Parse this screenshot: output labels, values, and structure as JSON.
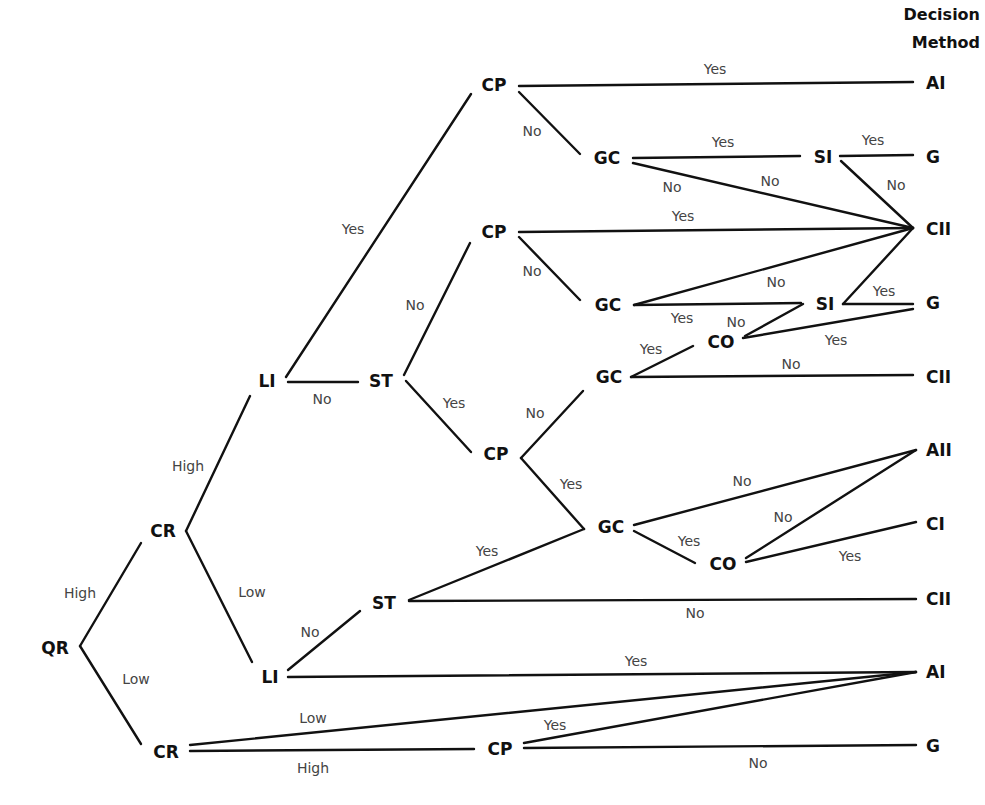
{
  "header": {
    "line1": "Decision",
    "line2": "Method"
  },
  "nodes": [
    {
      "id": "QR",
      "label": "QR",
      "x": 55,
      "y": 654,
      "anchor": "middle"
    },
    {
      "id": "CR1",
      "label": "CR",
      "x": 163,
      "y": 537,
      "anchor": "middle"
    },
    {
      "id": "CR2",
      "label": "CR",
      "x": 166,
      "y": 758,
      "anchor": "middle"
    },
    {
      "id": "LI1",
      "label": "LI",
      "x": 267,
      "y": 387,
      "anchor": "middle"
    },
    {
      "id": "LI2",
      "label": "LI",
      "x": 270,
      "y": 683,
      "anchor": "middle"
    },
    {
      "id": "ST1",
      "label": "ST",
      "x": 381,
      "y": 387,
      "anchor": "middle"
    },
    {
      "id": "ST2",
      "label": "ST",
      "x": 384,
      "y": 609,
      "anchor": "middle"
    },
    {
      "id": "CP1",
      "label": "CP",
      "x": 494,
      "y": 91,
      "anchor": "middle"
    },
    {
      "id": "CP2",
      "label": "CP",
      "x": 494,
      "y": 238,
      "anchor": "middle"
    },
    {
      "id": "CP3",
      "label": "CP",
      "x": 496,
      "y": 460,
      "anchor": "middle"
    },
    {
      "id": "CP4",
      "label": "CP",
      "x": 500,
      "y": 755,
      "anchor": "middle"
    },
    {
      "id": "GC1",
      "label": "GC",
      "x": 607,
      "y": 164,
      "anchor": "middle"
    },
    {
      "id": "GC2",
      "label": "GC",
      "x": 608,
      "y": 311,
      "anchor": "middle"
    },
    {
      "id": "GC3",
      "label": "GC",
      "x": 609,
      "y": 383,
      "anchor": "middle"
    },
    {
      "id": "GC4",
      "label": "GC",
      "x": 611,
      "y": 533,
      "anchor": "middle"
    },
    {
      "id": "CO1",
      "label": "CO",
      "x": 721,
      "y": 348,
      "anchor": "middle"
    },
    {
      "id": "CO2",
      "label": "CO",
      "x": 723,
      "y": 570,
      "anchor": "middle"
    },
    {
      "id": "SI1",
      "label": "SI",
      "x": 823,
      "y": 163,
      "anchor": "middle"
    },
    {
      "id": "SI2",
      "label": "SI",
      "x": 825,
      "y": 310,
      "anchor": "middle"
    },
    {
      "id": "AI1",
      "label": "AI",
      "x": 926,
      "y": 89,
      "anchor": "start"
    },
    {
      "id": "G1",
      "label": "G",
      "x": 926,
      "y": 163,
      "anchor": "start"
    },
    {
      "id": "CII1",
      "label": "CII",
      "x": 926,
      "y": 235,
      "anchor": "start"
    },
    {
      "id": "G2",
      "label": "G",
      "x": 926,
      "y": 309,
      "anchor": "start"
    },
    {
      "id": "CII2",
      "label": "CII",
      "x": 926,
      "y": 383,
      "anchor": "start"
    },
    {
      "id": "AII",
      "label": "AII",
      "x": 926,
      "y": 456,
      "anchor": "start"
    },
    {
      "id": "CI",
      "label": "CI",
      "x": 926,
      "y": 530,
      "anchor": "start"
    },
    {
      "id": "CII3",
      "label": "CII",
      "x": 926,
      "y": 605,
      "anchor": "start"
    },
    {
      "id": "AI2",
      "label": "AI",
      "x": 926,
      "y": 678,
      "anchor": "start"
    },
    {
      "id": "G3",
      "label": "G",
      "x": 926,
      "y": 752,
      "anchor": "start"
    }
  ],
  "edges": [
    {
      "from": "QR",
      "to": "CR1",
      "label": "High",
      "x1": 80,
      "y1": 646,
      "x2": 141,
      "y2": 543,
      "lx": 80,
      "ly": 598
    },
    {
      "from": "QR",
      "to": "CR2",
      "label": "Low",
      "x1": 80,
      "y1": 646,
      "x2": 141,
      "y2": 744,
      "lx": 136,
      "ly": 684
    },
    {
      "from": "CR1",
      "to": "LI1",
      "label": "High",
      "x1": 186,
      "y1": 531,
      "x2": 250,
      "y2": 396,
      "lx": 188,
      "ly": 471
    },
    {
      "from": "CR1",
      "to": "LI2",
      "label": "Low",
      "x1": 186,
      "y1": 531,
      "x2": 252,
      "y2": 662,
      "lx": 252,
      "ly": 597
    },
    {
      "from": "CR2",
      "to": "AI2",
      "label": "Low",
      "x1": 190,
      "y1": 745,
      "x2": 916,
      "y2": 672,
      "lx": 313,
      "ly": 723
    },
    {
      "from": "CR2",
      "to": "CP4",
      "label": "High",
      "x1": 190,
      "y1": 751,
      "x2": 474,
      "y2": 749,
      "lx": 313,
      "ly": 773
    },
    {
      "from": "LI1",
      "to": "CP1",
      "label": "Yes",
      "x1": 286,
      "y1": 377,
      "x2": 471,
      "y2": 94,
      "lx": 353,
      "ly": 234
    },
    {
      "from": "LI1",
      "to": "ST1",
      "label": "No",
      "x1": 288,
      "y1": 382,
      "x2": 358,
      "y2": 382,
      "lx": 322,
      "ly": 404
    },
    {
      "from": "LI2",
      "to": "ST2",
      "label": "No",
      "x1": 288,
      "y1": 670,
      "x2": 360,
      "y2": 611,
      "lx": 310,
      "ly": 637
    },
    {
      "from": "LI2",
      "to": "AI2",
      "label": "Yes",
      "x1": 288,
      "y1": 677,
      "x2": 916,
      "y2": 672,
      "lx": 636,
      "ly": 666
    },
    {
      "from": "ST1",
      "to": "CP2",
      "label": "No",
      "x1": 404,
      "y1": 375,
      "x2": 470,
      "y2": 243,
      "lx": 415,
      "ly": 310
    },
    {
      "from": "ST1",
      "to": "CP3",
      "label": "Yes",
      "x1": 406,
      "y1": 381,
      "x2": 471,
      "y2": 452,
      "lx": 454,
      "ly": 408
    },
    {
      "from": "ST2",
      "to": "GC4",
      "label": "Yes",
      "x1": 409,
      "y1": 600,
      "x2": 584,
      "y2": 529,
      "lx": 487,
      "ly": 556
    },
    {
      "from": "ST2",
      "to": "CII3",
      "label": "No",
      "x1": 409,
      "y1": 601,
      "x2": 916,
      "y2": 599,
      "lx": 695,
      "ly": 618
    },
    {
      "from": "CP1",
      "to": "AI1",
      "label": "Yes",
      "x1": 519,
      "y1": 86,
      "x2": 913,
      "y2": 82,
      "lx": 715,
      "ly": 74
    },
    {
      "from": "CP1",
      "to": "GC1",
      "label": "No",
      "x1": 519,
      "y1": 92,
      "x2": 580,
      "y2": 154,
      "lx": 532,
      "ly": 136
    },
    {
      "from": "CP2",
      "to": "CII1",
      "label": "Yes",
      "x1": 519,
      "y1": 232,
      "x2": 913,
      "y2": 228,
      "lx": 683,
      "ly": 221
    },
    {
      "from": "CP2",
      "to": "GC2",
      "label": "No",
      "x1": 519,
      "y1": 237,
      "x2": 580,
      "y2": 300,
      "lx": 532,
      "ly": 276
    },
    {
      "from": "CP3",
      "to": "GC3",
      "label": "No",
      "x1": 521,
      "y1": 458,
      "x2": 583,
      "y2": 391,
      "lx": 535,
      "ly": 418
    },
    {
      "from": "CP3",
      "to": "GC4",
      "label": "Yes",
      "x1": 521,
      "y1": 458,
      "x2": 584,
      "y2": 529,
      "lx": 571,
      "ly": 489
    },
    {
      "from": "CP4",
      "to": "AI2",
      "label": "Yes",
      "x1": 524,
      "y1": 743,
      "x2": 916,
      "y2": 672,
      "lx": 555,
      "ly": 730
    },
    {
      "from": "CP4",
      "to": "G3",
      "label": "No",
      "x1": 524,
      "y1": 748,
      "x2": 916,
      "y2": 745,
      "lx": 758,
      "ly": 768
    },
    {
      "from": "GC1",
      "to": "SI1",
      "label": "Yes",
      "x1": 633,
      "y1": 158,
      "x2": 800,
      "y2": 156,
      "lx": 723,
      "ly": 147
    },
    {
      "from": "GC1",
      "to": "CII1",
      "label": "No",
      "x1": 633,
      "y1": 163,
      "x2": 913,
      "y2": 228,
      "lx": 672,
      "ly": 192
    },
    {
      "from": "GC1",
      "to": "CII1",
      "label": "No",
      "x1": 633,
      "y1": 163,
      "x2": 913,
      "y2": 228,
      "lx": 770,
      "ly": 186,
      "hide_line": true
    },
    {
      "from": "SI1",
      "to": "G1",
      "label": "Yes",
      "x1": 840,
      "y1": 156,
      "x2": 913,
      "y2": 155,
      "lx": 873,
      "ly": 145
    },
    {
      "from": "SI1",
      "to": "CII1",
      "label": "No",
      "x1": 841,
      "y1": 161,
      "x2": 913,
      "y2": 228,
      "lx": 896,
      "ly": 190
    },
    {
      "from": "GC2",
      "to": "CII1",
      "label": "No",
      "x1": 634,
      "y1": 305,
      "x2": 913,
      "y2": 228,
      "lx": 776,
      "ly": 287
    },
    {
      "from": "GC2",
      "to": "SI2",
      "label": "Yes",
      "x1": 634,
      "y1": 305,
      "x2": 801,
      "y2": 303,
      "lx": 682,
      "ly": 323
    },
    {
      "from": "SI2",
      "to": "CO1",
      "label": "No",
      "x1": 803,
      "y1": 304,
      "x2": 745,
      "y2": 336,
      "lx": 736,
      "ly": 327
    },
    {
      "from": "SI2",
      "to": "CII1",
      "label": "Yes",
      "x1": 843,
      "y1": 304,
      "x2": 913,
      "y2": 228,
      "lx": 884,
      "ly": 296,
      "hide_label": true
    },
    {
      "from": "SI2",
      "to": "G2",
      "label": "Yes",
      "x1": 843,
      "y1": 304,
      "x2": 913,
      "y2": 304,
      "lx": 884,
      "ly": 296
    },
    {
      "from": "CO1",
      "to": "G2",
      "label": "Yes",
      "x1": 743,
      "y1": 338,
      "x2": 913,
      "y2": 309,
      "lx": 836,
      "ly": 345
    },
    {
      "from": "GC3",
      "to": "CO1",
      "label": "Yes",
      "x1": 631,
      "y1": 377,
      "x2": 693,
      "y2": 346,
      "lx": 651,
      "ly": 354
    },
    {
      "from": "GC3",
      "to": "CII2",
      "label": "No",
      "x1": 631,
      "y1": 377,
      "x2": 913,
      "y2": 375,
      "lx": 791,
      "ly": 369
    },
    {
      "from": "GC4",
      "to": "AII",
      "label": "No",
      "x1": 634,
      "y1": 525,
      "x2": 916,
      "y2": 450,
      "lx": 742,
      "ly": 486
    },
    {
      "from": "GC4",
      "to": "CO2",
      "label": "Yes",
      "x1": 634,
      "y1": 531,
      "x2": 695,
      "y2": 563,
      "lx": 689,
      "ly": 546
    },
    {
      "from": "CO2",
      "to": "AII",
      "label": "No",
      "x1": 746,
      "y1": 558,
      "x2": 916,
      "y2": 450,
      "lx": 783,
      "ly": 522
    },
    {
      "from": "CO2",
      "to": "CI",
      "label": "Yes",
      "x1": 746,
      "y1": 562,
      "x2": 916,
      "y2": 522,
      "lx": 850,
      "ly": 561
    }
  ]
}
